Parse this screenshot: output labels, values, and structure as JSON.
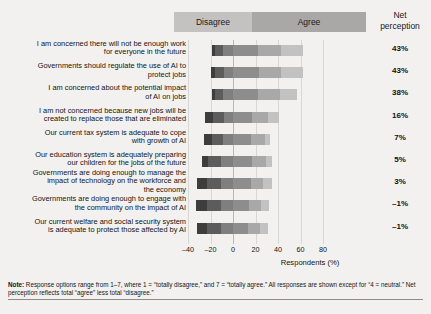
{
  "header": {
    "disagree_label": "Disagree",
    "agree_label": "Agree",
    "net_label_line1": "Net",
    "net_label_line2": "perception"
  },
  "axis": {
    "xlabel": "Respondents (%)",
    "ticks": [
      "–40",
      "–20",
      "0",
      "20",
      "40",
      "60",
      "80"
    ]
  },
  "note": {
    "prefix": "Note:",
    "line1": " Response options range from 1–7, where 1 = “totally disagree,” and 7 = “totally agree.” All responses are shown except for “4 = neutral.”",
    "line2": "Net perception reflects total “agree” less total “disagree.”"
  },
  "colors": {
    "disagree_dark": "#3d3d3d",
    "disagree_mid": "#5c5c5c",
    "disagree_light": "#7f7f7f",
    "agree_dark": "#8d8d8d",
    "agree_mid": "#a8a8a8",
    "agree_light": "#c2c2c2",
    "band_disagree": "#c3c2c0",
    "band_agree": "#a9a8a6",
    "background": "#f2f1ef"
  },
  "chart_data": {
    "type": "bar",
    "subtype": "diverging-stacked-bar",
    "title": "",
    "xlabel": "Respondents (%)",
    "ylabel": "",
    "xlim": [
      -40,
      80
    ],
    "grid": true,
    "legend_position": "top",
    "legend": [
      "Disagree",
      "Agree"
    ],
    "categories": [
      "I am concerned there will not be enough work for everyone in the future",
      "Governments should regulate the use of AI to protect jobs",
      "I am concerned about the potential impact of AI on jobs",
      "I am not concerned because new jobs will be created to replace those that are eliminated",
      "Our current tax system is adequate to cope with growth of AI",
      "Our education system is adequately preparing our children for the jobs of the future",
      "Governments are doing enough to manage the impact of technology on the workforce and the economy",
      "Governments are doing enough to engage with the community on the impact of AI",
      "Our current welfare and social security system is adequate to protect those affected by AI"
    ],
    "category_lines": [
      [
        "I am concerned there will not be enough work",
        "for everyone in the future"
      ],
      [
        "Governments should regulate the use of AI to",
        "protect jobs"
      ],
      [
        "I am concerned about the potential impact",
        "of AI on jobs"
      ],
      [
        "I am not concerned because new jobs will be",
        "created to replace those that are eliminated"
      ],
      [
        "Our current tax system is adequate to cope",
        "with growth of AI"
      ],
      [
        "Our education system is adequately preparing",
        "our children for the jobs of the future"
      ],
      [
        "Governments are doing enough to manage the",
        "impact of technology on the workforce and",
        "the economy"
      ],
      [
        "Governments are doing enough to engage with",
        "the community on the impact of AI"
      ],
      [
        "Our current welfare and social security system",
        "is adequate to protect those affected by AI"
      ]
    ],
    "series": [
      {
        "name": "Totally disagree",
        "side": "disagree",
        "shade": "disagree_dark",
        "values": [
          -3,
          -4,
          -3,
          -7,
          -7,
          -6,
          -9,
          -10,
          -9
        ]
      },
      {
        "name": "Disagree",
        "side": "disagree",
        "shade": "disagree_mid",
        "values": [
          -7,
          -8,
          -7,
          -10,
          -10,
          -11,
          -12,
          -12,
          -12
        ]
      },
      {
        "name": "Somewhat disagree",
        "side": "disagree",
        "shade": "disagree_light",
        "values": [
          -9,
          -8,
          -9,
          -8,
          -9,
          -11,
          -11,
          -11,
          -11
        ]
      },
      {
        "name": "Somewhat agree",
        "side": "agree",
        "shade": "agree_dark",
        "values": [
          22,
          23,
          22,
          17,
          16,
          17,
          16,
          14,
          13
        ]
      },
      {
        "name": "Agree",
        "side": "agree",
        "shade": "agree_mid",
        "values": [
          21,
          20,
          20,
          14,
          12,
          12,
          11,
          11,
          11
        ]
      },
      {
        "name": "Totally agree",
        "side": "agree",
        "shade": "agree_light",
        "values": [
          19,
          19,
          15,
          10,
          5,
          6,
          8,
          7,
          7
        ]
      }
    ],
    "net_perception_label": "Net perception",
    "net_perception": [
      "43%",
      "43%",
      "38%",
      "16%",
      "7%",
      "5%",
      "3%",
      "–1%",
      "–1%"
    ]
  }
}
